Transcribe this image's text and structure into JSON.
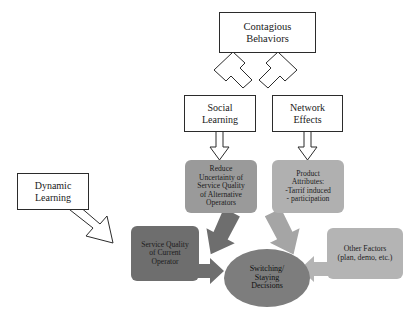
{
  "diagram": {
    "background_color": "#ffffff",
    "colors": {
      "outline": "#2b2b2b",
      "gray_medium": "#9a9a9a",
      "gray_light": "#b4b4b4",
      "gray_dark": "#6e6e6e",
      "ellipse_fill": "#7d7d7d",
      "arrow_dark": "#6e6e6e",
      "arrow_medium": "#8f8f8f",
      "arrow_light": "#b4b4b4",
      "text": "#1a1a1a"
    },
    "nodes": [
      {
        "id": "contagious-behaviors",
        "style": "white-rect",
        "lines": [
          "Contagious",
          "Behaviors"
        ]
      },
      {
        "id": "social-learning",
        "style": "white-rect",
        "lines": [
          "Social",
          "Learning"
        ]
      },
      {
        "id": "network-effects",
        "style": "white-rect",
        "lines": [
          "Network",
          "Effects"
        ]
      },
      {
        "id": "dynamic-learning",
        "style": "white-rect",
        "lines": [
          "Dynamic",
          "Learning"
        ]
      },
      {
        "id": "reduce-uncertainty",
        "style": "gray-rounded-medium",
        "lines": [
          "Reduce",
          "Uncertainty of",
          "Service Quality",
          "of Alternative",
          "Operators"
        ]
      },
      {
        "id": "product-attributes",
        "style": "gray-rounded-light",
        "lines": [
          "Product",
          "Attributes:",
          "-Tarrif induced",
          "- participation"
        ]
      },
      {
        "id": "service-quality-current",
        "style": "gray-rounded-dark",
        "lines": [
          "Service Quality",
          "of Current",
          "Operator"
        ]
      },
      {
        "id": "other-factors",
        "style": "gray-rounded-light",
        "lines": [
          "Other Factors",
          "(plan, demo, etc.)"
        ]
      },
      {
        "id": "switching-staying-decisions",
        "style": "ellipse-gray",
        "lines": [
          "Switching/",
          "Staying",
          "Decisions"
        ]
      }
    ],
    "edges": [
      {
        "id": "contagious-to-social",
        "style": "outlined-block-arrow",
        "direction": "down-left"
      },
      {
        "id": "contagious-to-network",
        "style": "outlined-block-arrow",
        "direction": "down-right"
      },
      {
        "id": "social-to-reduce",
        "style": "outlined-block-arrow",
        "direction": "down"
      },
      {
        "id": "network-to-product",
        "style": "outlined-block-arrow",
        "direction": "down"
      },
      {
        "id": "dynamic-to-service",
        "style": "outlined-block-arrow",
        "direction": "down-right"
      },
      {
        "id": "reduce-to-decisions",
        "style": "filled-block-arrow",
        "direction": "down-right",
        "color": "#6e6e6e"
      },
      {
        "id": "product-to-decisions",
        "style": "filled-block-arrow",
        "direction": "down-left",
        "color": "#a5a5a5"
      },
      {
        "id": "service-to-decisions",
        "style": "filled-block-arrow",
        "direction": "right",
        "color": "#6e6e6e"
      },
      {
        "id": "other-factors-to-decisions",
        "style": "filled-block-arrow",
        "direction": "left",
        "color": "#b4b4b4"
      }
    ]
  }
}
